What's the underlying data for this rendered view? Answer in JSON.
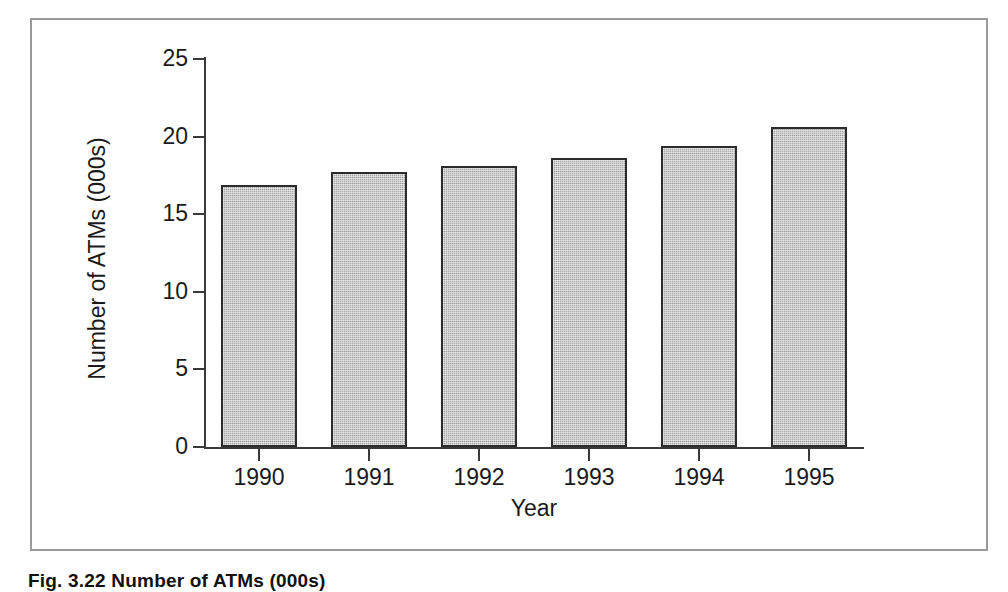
{
  "figure": {
    "caption": "Fig. 3.22 Number of ATMs (000s)"
  },
  "chart_data": {
    "type": "bar",
    "title": "",
    "categories": [
      "1990",
      "1991",
      "1992",
      "1993",
      "1994",
      "1995"
    ],
    "values": [
      16.9,
      17.7,
      18.1,
      18.6,
      19.4,
      20.6
    ],
    "series": [
      {
        "name": "Number of ATMs (000s)",
        "values": [
          16.9,
          17.7,
          18.1,
          18.6,
          19.4,
          20.6
        ]
      }
    ],
    "xlabel": "Year",
    "ylabel": "Number of ATMs (000s)",
    "ylim": [
      0,
      25
    ],
    "yticks": [
      "0",
      "5",
      "10",
      "15",
      "20",
      "25"
    ],
    "ytick_values": [
      0,
      5,
      10,
      15,
      20,
      25
    ],
    "grid": false,
    "legend": false,
    "bar_fill_color": "#a9a9a9",
    "bar_border_color": "#2b2b2b",
    "axis_color": "#3a3a3a",
    "frame_color": "#9a9a9a",
    "background_color": "#ffffff"
  }
}
